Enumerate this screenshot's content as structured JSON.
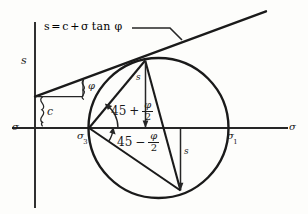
{
  "figure": {
    "type": "mohr-circle-failure-envelope",
    "title_equation": {
      "lhs": "s",
      "equals": "=",
      "cohesion": "c",
      "plus": "+",
      "normal_stress": "σ",
      "tan": "tan",
      "friction_angle": "φ"
    },
    "axes": {
      "vertical_label": "s",
      "horizontal_label_left": "σ",
      "horizontal_label_right": "σ"
    },
    "points": {
      "sigma3": "σ",
      "sigma3_sub": "3",
      "sigma1": "σ",
      "sigma1_sub": "1"
    },
    "intercept_label": "c",
    "slope_angle_label": "φ",
    "shear_labels": {
      "upper": "s",
      "lower": "s"
    },
    "angles": {
      "upper": {
        "base": "45",
        "operator": "+",
        "numerator": "φ",
        "denominator": "2"
      },
      "lower": {
        "base": "45",
        "operator": "−",
        "numerator": "φ",
        "denominator": "2"
      }
    },
    "colors": {
      "background": "#fdfdfb",
      "ink": "#1a1a1a",
      "line": "#262626"
    }
  }
}
